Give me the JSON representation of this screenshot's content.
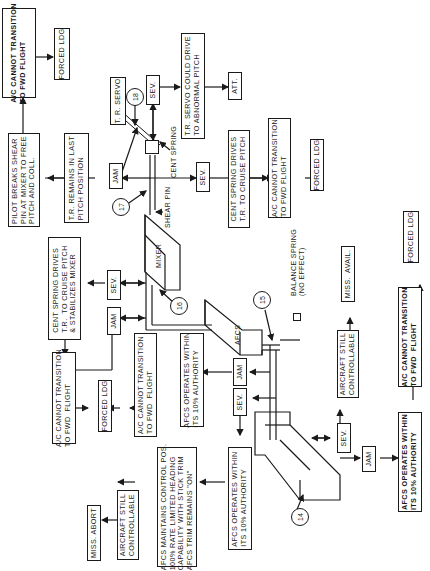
{
  "diagram": {
    "type": "failure-mode flowchart (rotated 90°)",
    "callouts": [
      "14",
      "15",
      "16",
      "17",
      "18"
    ],
    "components": {
      "tr_servo": "T. R. SERVO",
      "cent_spring": "CENT SPRING",
      "shear_pin": "SHEAR PIN",
      "mixer": "MIXER",
      "afcs": "AFCS",
      "balance_spring": "BALANCE SPRING\n(NO EFFECT)"
    },
    "boxes": {
      "top_cannot_transition": "A/C CANNOT TRANSITION\nTO FWD FLIGHT",
      "top_forced_ldg": "FORCED LDG",
      "pilot_breaks": "PILOT BREAKS SHEAR\nPIN AT MIXER TO FREE\nPITCH AND COLL.",
      "tr_remains": "T.R. REMAINS IN LAST\nPITCH POSITION",
      "jam_17": "JAM",
      "sev_18": "SEV.",
      "tr_servo_drive": "T.R. SERVO COULD DRIVE\nTO ABNORMAL PITCH",
      "att": "ATT.",
      "sev_17": "SEV.",
      "cent_spring_drives": "CENT SPRING DRIVES\nT.R. TO CRUISE PITCH",
      "mid_cannot_transition": "A/C CANNOT TRANSITION\nTO FWD FLIGHT",
      "mid_forced_ldg": "FORCED LDG",
      "cent_spring_stabilizes": "CENT SPRING DRIVES\nT.R.  TO CRUISE PITCH\n& STABILIZES MIXER",
      "sev_16": "SEV.",
      "jam_16": "JAM",
      "left_cannot_transition": "A/C CANNOT TRANSITION\nTO FWD  FLIGHT",
      "left_forced_ldg": "FORCED LDG",
      "afcs_cannot_transition": "A/C CANNOT TRANSITION\nTO FWD  FLIGHT",
      "afcs_operates_15_jam": "AFCS OPERATES WITHIN\nITS 10% AUTHORITY",
      "jam_15": "JAM",
      "sev_15": "SEV.",
      "afcs_operates_15_sev": "AFCS OPERATES WITHIN\nITS 10% AUTHORITY",
      "afcs_maintains": "AFCS MAINTAINS CONTROL POS.\n100% RATE LIMITED HEADING\nCAPABILITY WITH STICK TRIM\nAFCS TRIM REMAINS \"ON\"",
      "aircraft_still_left": "AIRCRAFT STILL\nCONTROLLABLE",
      "miss_abort": "MISS. ABORT",
      "sev_14": "SEV.",
      "aircraft_still_right": "AIRCRAFT STILL\nCONTROLLABLE",
      "miss_avail": "MISS.  AVAIL.",
      "jam_14": "JAM",
      "afcs_operates_14": "AFCS OPERATES WITHIN\nITS 10% AUTHORITY",
      "right_cannot_transition": "A/C CANNOT TRANSITION\nTO FWD  FLIGHT",
      "right_forced_ldg": "FORCED LDG"
    }
  }
}
